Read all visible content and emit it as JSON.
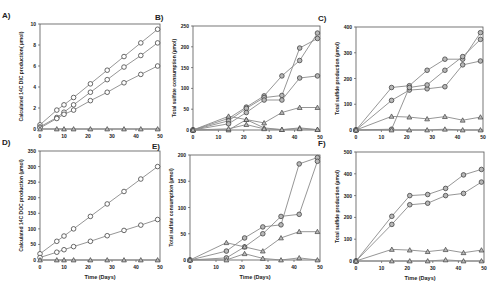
{
  "figure": {
    "panels": [
      {
        "id": "A",
        "label": "A)"
      },
      {
        "id": "B",
        "label": "B)"
      },
      {
        "id": "C",
        "label": "C)"
      },
      {
        "id": "D",
        "label": "D)"
      },
      {
        "id": "E",
        "label": "E)"
      },
      {
        "id": "F",
        "label": "F)"
      }
    ],
    "colors": {
      "line": "#8a8a8a",
      "marker_edge": "#444444",
      "marker_fill_open": "#ffffff",
      "marker_fill_grey": "#b8b8b8",
      "axis": "#555555"
    }
  },
  "chart_data": [
    {
      "panel": "A",
      "label": "A)",
      "type": "line",
      "title": "",
      "xlabel": "",
      "ylabel": "Calculated 14C DIC production( µmol)",
      "xlim": [
        0,
        50
      ],
      "ylim": [
        0,
        10
      ],
      "xticks": [
        0,
        10,
        20,
        30,
        40,
        50
      ],
      "yticks": [
        0,
        2,
        4,
        6,
        8,
        10
      ],
      "grid": false,
      "frame": {
        "x0": 40,
        "x1": 160,
        "y0": 24,
        "y1": 129
      },
      "series": [
        {
          "name": "circle-1",
          "marker": "circle-open",
          "x": [
            0,
            7,
            10,
            14,
            21,
            28,
            35,
            42,
            49
          ],
          "y": [
            0.4,
            1.8,
            2.3,
            3.0,
            4.3,
            5.6,
            6.9,
            8.2,
            9.5
          ]
        },
        {
          "name": "circle-2",
          "marker": "circle-open",
          "x": [
            0,
            7,
            10,
            14,
            21,
            28,
            35,
            42,
            49
          ],
          "y": [
            0.2,
            1.1,
            1.6,
            2.3,
            3.5,
            4.7,
            5.9,
            7.0,
            8.2
          ]
        },
        {
          "name": "circle-3",
          "marker": "circle-open",
          "x": [
            0,
            7,
            10,
            14,
            21,
            28,
            35,
            42,
            49
          ],
          "y": [
            0.1,
            1.0,
            1.4,
            1.8,
            2.7,
            3.5,
            4.4,
            5.2,
            6.0
          ]
        },
        {
          "name": "triangle-1",
          "marker": "triangle-grey",
          "x": [
            0,
            7,
            10,
            14,
            21,
            28,
            35,
            42,
            49
          ],
          "y": [
            0,
            0,
            0,
            0,
            0,
            0,
            0,
            0,
            0
          ]
        }
      ]
    },
    {
      "panel": "B",
      "label": "B)",
      "type": "line",
      "title": "",
      "xlabel": "",
      "ylabel": "Total sulfate consumption (µmol)",
      "xlim": [
        0,
        50
      ],
      "ylim": [
        0,
        250
      ],
      "xticks": [
        0,
        10,
        20,
        30,
        40,
        50
      ],
      "yticks": [
        0,
        50,
        100,
        150,
        200,
        250
      ],
      "grid": false,
      "frame": {
        "x0": 193,
        "x1": 320,
        "y0": 26,
        "y1": 130
      },
      "series": [
        {
          "name": "circle-1",
          "marker": "circle-grey",
          "x": [
            0,
            14,
            21,
            28,
            35,
            42,
            49
          ],
          "y": [
            0,
            28,
            55,
            82,
            130,
            167,
            233
          ]
        },
        {
          "name": "circle-2",
          "marker": "circle-grey",
          "x": [
            0,
            14,
            21,
            28,
            35,
            42,
            49
          ],
          "y": [
            0,
            22,
            52,
            78,
            83,
            197,
            220
          ]
        },
        {
          "name": "circle-3",
          "marker": "circle-grey",
          "x": [
            0,
            14,
            21,
            28,
            35,
            42,
            49
          ],
          "y": [
            0,
            15,
            42,
            72,
            72,
            125,
            130
          ]
        },
        {
          "name": "triangle-1",
          "marker": "triangle-grey",
          "x": [
            0,
            14,
            21,
            28,
            35,
            42,
            49
          ],
          "y": [
            0,
            0,
            25,
            17,
            42,
            54,
            54
          ]
        },
        {
          "name": "triangle-2",
          "marker": "triangle-grey",
          "x": [
            0,
            14,
            21,
            28,
            35,
            42,
            49
          ],
          "y": [
            0,
            33,
            25,
            5,
            1,
            5,
            1
          ]
        },
        {
          "name": "triangle-3",
          "marker": "triangle-grey",
          "x": [
            0,
            14,
            21,
            28,
            35,
            42,
            49
          ],
          "y": [
            0,
            3,
            13,
            3,
            1,
            3,
            1
          ]
        }
      ]
    },
    {
      "panel": "C",
      "label": "C)",
      "type": "line",
      "title": "",
      "xlabel": "",
      "ylabel": "Total sulfide production (µmol)",
      "xlim": [
        0,
        50
      ],
      "ylim": [
        0,
        400
      ],
      "xticks": [
        0,
        10,
        20,
        30,
        40,
        50
      ],
      "yticks": [
        0,
        100,
        200,
        300,
        400
      ],
      "grid": false,
      "frame": {
        "x0": 356,
        "x1": 483,
        "y0": 27,
        "y1": 130
      },
      "series": [
        {
          "name": "circle-1",
          "marker": "circle-grey",
          "x": [
            0,
            14,
            21,
            28,
            35,
            42,
            49
          ],
          "y": [
            0,
            165,
            172,
            232,
            275,
            275,
            378
          ]
        },
        {
          "name": "circle-2",
          "marker": "circle-grey",
          "x": [
            0,
            14,
            21,
            28,
            35,
            42,
            49
          ],
          "y": [
            0,
            115,
            155,
            160,
            168,
            253,
            268
          ]
        },
        {
          "name": "circle-3",
          "marker": "circle-grey",
          "x": [
            0,
            14,
            21,
            28,
            35,
            42,
            49
          ],
          "y": [
            0,
            3,
            165,
            175,
            232,
            285,
            352
          ]
        },
        {
          "name": "triangle-1",
          "marker": "triangle-grey",
          "x": [
            0,
            14,
            21,
            28,
            35,
            42,
            49
          ],
          "y": [
            0,
            53,
            50,
            43,
            52,
            38,
            50
          ]
        },
        {
          "name": "triangle-2",
          "marker": "triangle-grey",
          "x": [
            0,
            14,
            21,
            28,
            35,
            42,
            49
          ],
          "y": [
            0,
            0,
            0,
            0,
            3,
            0,
            0
          ]
        }
      ]
    },
    {
      "panel": "D",
      "label": "D)",
      "type": "line",
      "title": "",
      "xlabel": "Time (Days)",
      "ylabel": "Calculated 14C DOC production (µmol)",
      "xlim": [
        0,
        50
      ],
      "ylim": [
        0,
        350
      ],
      "xticks": [
        0,
        10,
        20,
        30,
        40,
        50
      ],
      "yticks": [
        0,
        50,
        100,
        150,
        200,
        250,
        300,
        350
      ],
      "grid": false,
      "frame": {
        "x0": 40,
        "x1": 160,
        "y0": 151,
        "y1": 260
      },
      "series": [
        {
          "name": "circle-1",
          "marker": "circle-open",
          "x": [
            0,
            7,
            10,
            14,
            21,
            28,
            35,
            42,
            49
          ],
          "y": [
            20,
            60,
            77,
            100,
            140,
            180,
            220,
            260,
            300
          ]
        },
        {
          "name": "circle-2",
          "marker": "circle-open",
          "x": [
            0,
            7,
            10,
            14,
            21,
            28,
            35,
            42,
            49
          ],
          "y": [
            8,
            25,
            33,
            43,
            60,
            78,
            95,
            112,
            130
          ]
        },
        {
          "name": "triangle-1",
          "marker": "triangle-grey",
          "x": [
            0,
            7,
            10,
            14,
            21,
            28,
            35,
            42,
            49
          ],
          "y": [
            0,
            0,
            0,
            0,
            0,
            0,
            0,
            0,
            0
          ]
        }
      ]
    },
    {
      "panel": "E",
      "label": "E)",
      "type": "line",
      "title": "",
      "xlabel": "Time (Days)",
      "ylabel": "Total sulfate consumption (µmol)",
      "xlim": [
        0,
        50
      ],
      "ylim": [
        0,
        200
      ],
      "xticks": [
        0,
        10,
        20,
        30,
        40,
        50
      ],
      "yticks": [
        0,
        50,
        100,
        150,
        200
      ],
      "grid": false,
      "frame": {
        "x0": 190,
        "x1": 320,
        "y0": 155,
        "y1": 260
      },
      "series": [
        {
          "name": "circle-1",
          "marker": "circle-grey",
          "x": [
            0,
            14,
            21,
            28,
            35,
            42,
            49
          ],
          "y": [
            0,
            17,
            42,
            63,
            67,
            183,
            195
          ]
        },
        {
          "name": "circle-2",
          "marker": "circle-grey",
          "x": [
            0,
            14,
            21,
            28,
            35,
            42,
            49
          ],
          "y": [
            0,
            4,
            25,
            50,
            83,
            87,
            188
          ]
        },
        {
          "name": "triangle-1",
          "marker": "triangle-grey",
          "x": [
            0,
            14,
            21,
            28,
            35,
            42,
            49
          ],
          "y": [
            0,
            33,
            25,
            17,
            42,
            54,
            54
          ]
        },
        {
          "name": "triangle-2",
          "marker": "triangle-grey",
          "x": [
            0,
            14,
            21,
            28,
            35,
            42,
            49
          ],
          "y": [
            0,
            0,
            12,
            3,
            0,
            4,
            0
          ]
        }
      ]
    },
    {
      "panel": "F",
      "label": "F)",
      "type": "line",
      "title": "",
      "xlabel": "Time (Days)",
      "ylabel": "Total sulfide production (µmol)",
      "xlim": [
        0,
        50
      ],
      "ylim": [
        0,
        500
      ],
      "xticks": [
        0,
        10,
        20,
        30,
        40,
        50
      ],
      "yticks": [
        0,
        100,
        200,
        300,
        400,
        500
      ],
      "grid": false,
      "frame": {
        "x0": 356,
        "x1": 484,
        "y0": 152,
        "y1": 261
      },
      "series": [
        {
          "name": "circle-1",
          "marker": "circle-grey",
          "x": [
            0,
            14,
            21,
            28,
            35,
            42,
            49
          ],
          "y": [
            0,
            205,
            300,
            305,
            333,
            395,
            420
          ]
        },
        {
          "name": "circle-2",
          "marker": "circle-grey",
          "x": [
            0,
            14,
            21,
            28,
            35,
            42,
            49
          ],
          "y": [
            0,
            168,
            258,
            265,
            300,
            310,
            362
          ]
        },
        {
          "name": "triangle-1",
          "marker": "triangle-grey",
          "x": [
            0,
            14,
            21,
            28,
            35,
            42,
            49
          ],
          "y": [
            0,
            53,
            50,
            43,
            52,
            38,
            50
          ]
        },
        {
          "name": "triangle-2",
          "marker": "triangle-grey",
          "x": [
            0,
            14,
            21,
            28,
            35,
            42,
            49
          ],
          "y": [
            0,
            0,
            0,
            0,
            5,
            0,
            0
          ]
        }
      ]
    }
  ]
}
